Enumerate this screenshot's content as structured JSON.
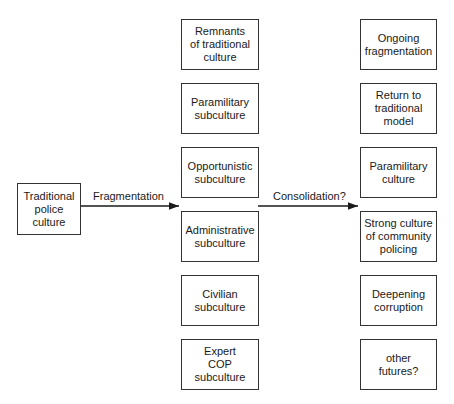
{
  "diagram": {
    "source": {
      "label": "Traditional\npolice\nculture"
    },
    "arrow_1": {
      "label": "Fragmentation"
    },
    "arrow_2": {
      "label": "Consolidation?"
    },
    "subcultures": [
      {
        "label": "Remnants\nof traditional\nculture"
      },
      {
        "label": "Paramilitary\nsubculture"
      },
      {
        "label": "Opportunistic\nsubculture"
      },
      {
        "label": "Administrative\nsubculture"
      },
      {
        "label": "Civilian\nsubculture"
      },
      {
        "label": "Expert\nCOP\nsubculture"
      }
    ],
    "futures": [
      {
        "label": "Ongoing\nfragmentation"
      },
      {
        "label": "Return to\ntraditional\nmodel"
      },
      {
        "label": "Paramilitary\nculture"
      },
      {
        "label": "Strong culture\nof community\npolicing"
      },
      {
        "label": "Deepening\ncorruption"
      },
      {
        "label": "other\nfutures?"
      }
    ],
    "colors": {
      "line": "#1a1a1a",
      "box_border": "#333333",
      "background": "#ffffff"
    }
  }
}
